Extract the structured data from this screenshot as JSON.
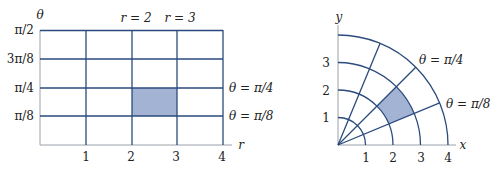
{
  "colors": {
    "line": "#2b4a7d",
    "axis": "#9aa0a8",
    "shade": "#a3b3d4",
    "text": "#222222"
  },
  "left_diagram": {
    "title": "Rectangle in the r-theta plane",
    "axis_labels": {
      "horizontal": "r",
      "vertical": "θ"
    },
    "r_ticks": [
      "1",
      "2",
      "3",
      "4"
    ],
    "theta_ticks": [
      "π/8",
      "π/4",
      "3π/8",
      "π/2"
    ],
    "top_labels": [
      "r = 2",
      "r = 3"
    ],
    "right_labels": [
      "θ = π/4",
      "θ = π/8"
    ],
    "shaded_region": {
      "r_min": 2,
      "r_max": 3,
      "theta_min": "π/8",
      "theta_max": "π/4"
    }
  },
  "right_diagram": {
    "title": "Polar rectangle in the xy plane",
    "axis_labels": {
      "horizontal": "x",
      "vertical": "y"
    },
    "x_ticks": [
      "1",
      "2",
      "3",
      "4"
    ],
    "y_ticks": [
      "1",
      "2",
      "3"
    ],
    "ray_labels": [
      "θ = π/4",
      "θ = π/8"
    ],
    "shaded_region": {
      "r_min": 2,
      "r_max": 3,
      "theta_min": "π/8",
      "theta_max": "π/4"
    }
  }
}
